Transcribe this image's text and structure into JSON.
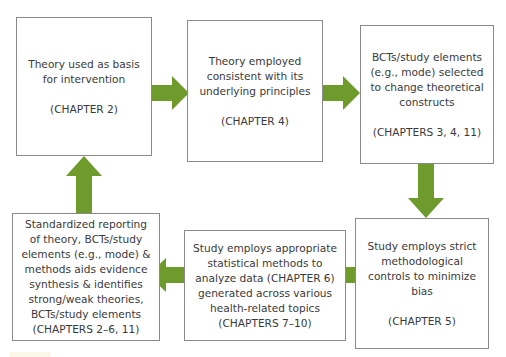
{
  "diagram": {
    "type": "cyclic-flowchart",
    "arrow_color": "#6e9b2c",
    "box_border_color": "#8a8a8a",
    "text_color": "#3a3a3a",
    "nodes": [
      {
        "id": "theory-basis",
        "text": "Theory used as basis for intervention",
        "chapter": "(CHAPTER 2)"
      },
      {
        "id": "theory-consistent",
        "text": "Theory employed consistent with its underlying principles",
        "chapter": "(CHAPTER 4)"
      },
      {
        "id": "bcts-selected",
        "text": "BCTs/study elements (e.g., mode) selected to change theoretical constructs",
        "chapter": "(CHAPTERS 3, 4, 11)"
      },
      {
        "id": "methodological-controls",
        "text": "Study employs strict methodological controls to minimize bias",
        "chapter": "(CHAPTER 5)"
      },
      {
        "id": "statistical-methods",
        "text": "Study employs appropriate statistical methods to analyze data (CHAPTER 6) generated across various health-related topics (CHAPTERS 7–10)",
        "chapter": ""
      },
      {
        "id": "standardized-reporting",
        "text": "Standardized reporting of theory, BCTs/study elements (e.g., mode) & methods aids evidence synthesis & identifies strong/weak theories, BCTs/study elements",
        "chapter": "(CHAPTERS 2–6, 11)"
      }
    ],
    "edges": [
      {
        "from": "theory-basis",
        "to": "theory-consistent",
        "direction": "right"
      },
      {
        "from": "theory-consistent",
        "to": "bcts-selected",
        "direction": "right"
      },
      {
        "from": "bcts-selected",
        "to": "methodological-controls",
        "direction": "down"
      },
      {
        "from": "methodological-controls",
        "to": "statistical-methods",
        "direction": "left"
      },
      {
        "from": "statistical-methods",
        "to": "standardized-reporting",
        "direction": "left"
      },
      {
        "from": "standardized-reporting",
        "to": "theory-basis",
        "direction": "up"
      }
    ]
  }
}
